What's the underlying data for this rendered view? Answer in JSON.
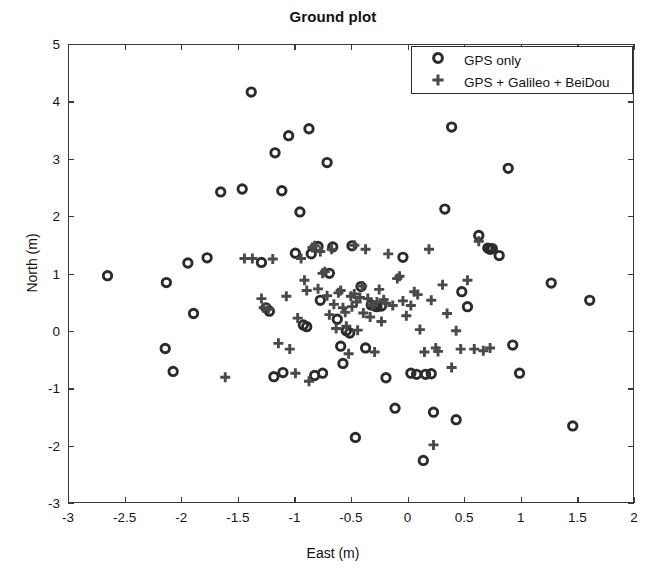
{
  "chart_data": {
    "type": "scatter",
    "title": "Ground plot",
    "xlabel": "East (m)",
    "ylabel": "North (m)",
    "xlim": [
      -3,
      2
    ],
    "ylim": [
      -3,
      5
    ],
    "xticks": [
      -3,
      -2.5,
      -2,
      -1.5,
      -1,
      -0.5,
      0,
      0.5,
      1,
      1.5,
      2
    ],
    "xticklabels": [
      "-3",
      "-2.5",
      "-2",
      "-1.5",
      "-1",
      "-0.5",
      "0",
      "0.5",
      "1",
      "1.5",
      "2"
    ],
    "yticks": [
      -3,
      -2,
      -1,
      0,
      1,
      2,
      3,
      4,
      5
    ],
    "yticklabels": [
      "-3",
      "-2",
      "-1",
      "0",
      "1",
      "2",
      "3",
      "4",
      "5"
    ],
    "grid": false,
    "legend_position": "upper right",
    "marker_color": "#2b2b2b",
    "series": [
      {
        "name": "GPS only",
        "marker": "circle",
        "points": [
          [
            -2.66,
            0.98
          ],
          [
            -2.14,
            0.86
          ],
          [
            -2.15,
            -0.29
          ],
          [
            -2.08,
            -0.69
          ],
          [
            -1.95,
            1.2
          ],
          [
            -1.9,
            0.32
          ],
          [
            -1.78,
            1.29
          ],
          [
            -1.66,
            2.44
          ],
          [
            -1.47,
            2.49
          ],
          [
            -1.39,
            4.18
          ],
          [
            -1.3,
            1.21
          ],
          [
            -1.26,
            0.42
          ],
          [
            -1.23,
            0.36
          ],
          [
            -1.19,
            -0.78
          ],
          [
            -1.18,
            3.12
          ],
          [
            -1.12,
            2.46
          ],
          [
            -1.11,
            -0.71
          ],
          [
            -1.06,
            3.42
          ],
          [
            -1.0,
            1.37
          ],
          [
            -0.96,
            2.09
          ],
          [
            -0.93,
            0.12
          ],
          [
            -0.9,
            0.09
          ],
          [
            -0.88,
            3.54
          ],
          [
            -0.86,
            1.36
          ],
          [
            -0.83,
            -0.76
          ],
          [
            -0.8,
            1.49
          ],
          [
            -0.78,
            0.55
          ],
          [
            -0.76,
            -0.72
          ],
          [
            -0.72,
            2.95
          ],
          [
            -0.7,
            1.02
          ],
          [
            -0.67,
            1.48
          ],
          [
            -0.63,
            0.22
          ],
          [
            -0.6,
            -0.25
          ],
          [
            -0.58,
            -0.55
          ],
          [
            -0.55,
            0.02
          ],
          [
            -0.52,
            -0.02
          ],
          [
            -0.5,
            1.5
          ],
          [
            -0.47,
            -1.84
          ],
          [
            -0.42,
            0.79
          ],
          [
            -0.38,
            -0.28
          ],
          [
            -0.33,
            0.47
          ],
          [
            -0.3,
            0.45
          ],
          [
            -0.28,
            0.44
          ],
          [
            -0.24,
            0.45
          ],
          [
            -0.2,
            -0.8
          ],
          [
            -0.12,
            -1.33
          ],
          [
            -0.05,
            1.3
          ],
          [
            0.02,
            -0.72
          ],
          [
            0.07,
            -0.74
          ],
          [
            0.13,
            -2.24
          ],
          [
            0.15,
            -0.74
          ],
          [
            0.2,
            -0.73
          ],
          [
            0.22,
            -1.4
          ],
          [
            0.32,
            2.14
          ],
          [
            0.38,
            3.57
          ],
          [
            0.42,
            -1.53
          ],
          [
            0.47,
            0.7
          ],
          [
            0.52,
            0.44
          ],
          [
            0.62,
            1.68
          ],
          [
            0.7,
            1.46
          ],
          [
            0.72,
            1.44
          ],
          [
            0.74,
            1.45
          ],
          [
            0.8,
            1.33
          ],
          [
            0.88,
            2.85
          ],
          [
            0.92,
            -0.23
          ],
          [
            0.98,
            -0.72
          ],
          [
            1.26,
            0.85
          ],
          [
            1.45,
            -1.64
          ],
          [
            1.6,
            0.55
          ]
        ]
      },
      {
        "name": "GPS + Galileo + BeiDou",
        "marker": "plus",
        "points": [
          [
            -1.62,
            -0.79
          ],
          [
            -1.38,
            1.28
          ],
          [
            -1.3,
            0.58
          ],
          [
            -1.28,
            0.42
          ],
          [
            -1.24,
            0.4
          ],
          [
            -1.2,
            1.27
          ],
          [
            -1.15,
            -0.2
          ],
          [
            -1.08,
            0.62
          ],
          [
            -1.05,
            -0.3
          ],
          [
            -1.0,
            -0.72
          ],
          [
            -0.98,
            0.24
          ],
          [
            -0.95,
            1.28
          ],
          [
            -0.92,
            0.9
          ],
          [
            -0.9,
            0.72
          ],
          [
            -0.88,
            -0.86
          ],
          [
            -0.85,
            1.47
          ],
          [
            -0.83,
            1.5
          ],
          [
            -0.8,
            0.75
          ],
          [
            -0.78,
            1.4
          ],
          [
            -0.76,
            1.02
          ],
          [
            -0.74,
            1.05
          ],
          [
            -0.72,
            0.63
          ],
          [
            -0.7,
            0.3
          ],
          [
            -0.68,
            1.44
          ],
          [
            -0.66,
            0.48
          ],
          [
            -0.64,
            0.06
          ],
          [
            -0.62,
            0.68
          ],
          [
            -0.6,
            0.72
          ],
          [
            -0.58,
            0.42
          ],
          [
            -0.56,
            0.34
          ],
          [
            -0.55,
            0.1
          ],
          [
            -0.53,
            -0.38
          ],
          [
            -0.51,
            0.62
          ],
          [
            -0.5,
            0.44
          ],
          [
            -0.48,
            0.66
          ],
          [
            -0.46,
            0.52
          ],
          [
            -0.45,
            0.03
          ],
          [
            -0.43,
            0.6
          ],
          [
            -0.41,
            0.8
          ],
          [
            -0.4,
            0.33
          ],
          [
            -0.38,
            1.44
          ],
          [
            -0.36,
            0.58
          ],
          [
            -0.34,
            0.26
          ],
          [
            -0.32,
            0.46
          ],
          [
            -0.3,
            -0.35
          ],
          [
            -0.28,
            0.52
          ],
          [
            -0.26,
            0.74
          ],
          [
            -0.24,
            0.18
          ],
          [
            -0.22,
            0.56
          ],
          [
            -0.2,
            0.5
          ],
          [
            -0.18,
            1.36
          ],
          [
            -0.14,
            0.46
          ],
          [
            -0.1,
            0.93
          ],
          [
            -0.08,
            0.97
          ],
          [
            -0.05,
            0.54
          ],
          [
            -0.02,
            0.28
          ],
          [
            0.02,
            0.46
          ],
          [
            0.05,
            0.7
          ],
          [
            0.08,
            0.65
          ],
          [
            0.1,
            0.04
          ],
          [
            0.14,
            -0.35
          ],
          [
            0.18,
            1.44
          ],
          [
            0.2,
            0.55
          ],
          [
            0.24,
            -0.28
          ],
          [
            0.26,
            -0.34
          ],
          [
            0.3,
            0.82
          ],
          [
            0.34,
            0.32
          ],
          [
            0.38,
            -0.62
          ],
          [
            0.42,
            0.02
          ],
          [
            0.46,
            -0.3
          ],
          [
            0.52,
            0.9
          ],
          [
            0.58,
            -0.3
          ],
          [
            0.62,
            1.58
          ],
          [
            0.66,
            -0.33
          ],
          [
            0.72,
            -0.28
          ],
          [
            0.22,
            -1.97
          ],
          [
            -0.48,
            1.51
          ],
          [
            -1.45,
            1.28
          ]
        ]
      }
    ]
  },
  "legend": {
    "items": [
      {
        "marker_glyph": "circle",
        "label": "GPS only"
      },
      {
        "marker_glyph": "plus",
        "label": "GPS + Galileo + BeiDou"
      }
    ]
  }
}
